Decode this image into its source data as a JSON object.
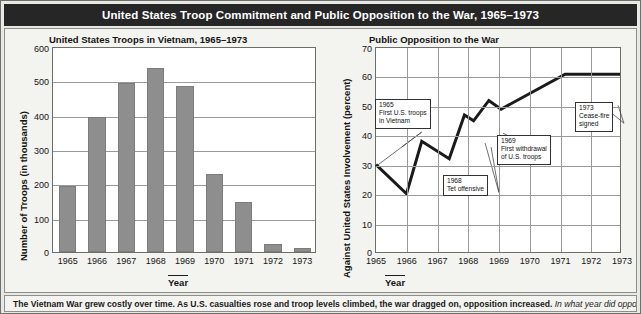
{
  "header": {
    "title": "United States Troop Commitment and Public Opposition to the War, 1965–1973"
  },
  "caption": {
    "lead": "The Vietnam War grew costly over time. As U.S. casualties rose and troop levels climbed, the war dragged on, opposition increased.",
    "question": "In what year did opposition"
  },
  "chart_data": [
    {
      "type": "bar",
      "title": "United States Troops in Vietnam, 1965–1973",
      "xlabel": "Year",
      "ylabel": "Number of Troops (in thousands)",
      "categories": [
        "1965",
        "1966",
        "1967",
        "1968",
        "1969",
        "1970",
        "1971",
        "1972",
        "1973"
      ],
      "values": [
        192,
        393,
        493,
        536,
        484,
        226,
        145,
        24,
        12
      ],
      "ylim": [
        0,
        600
      ],
      "yticks": [
        0,
        100,
        200,
        300,
        400,
        500,
        600
      ],
      "grid": true,
      "bar_color": "#8e8e8e"
    },
    {
      "type": "line",
      "title": "Public Opposition to the War",
      "xlabel": "Year",
      "ylabel": "Against United States Involvement (percent)",
      "ylim": [
        0,
        70
      ],
      "yticks": [
        0,
        10,
        20,
        30,
        40,
        50,
        60,
        70
      ],
      "xticks": [
        "1965",
        "1966",
        "1967",
        "1968",
        "1969",
        "1970",
        "1971",
        "1972",
        "1973"
      ],
      "grid": true,
      "line_color": "#1a1a1a",
      "points": [
        {
          "x": 1965.0,
          "y": 30
        },
        {
          "x": 1966.0,
          "y": 20
        },
        {
          "x": 1966.5,
          "y": 38
        },
        {
          "x": 1967.4,
          "y": 32
        },
        {
          "x": 1967.9,
          "y": 47
        },
        {
          "x": 1968.2,
          "y": 45
        },
        {
          "x": 1968.7,
          "y": 52
        },
        {
          "x": 1969.1,
          "y": 49
        },
        {
          "x": 1971.2,
          "y": 61
        },
        {
          "x": 1972.6,
          "y": 61
        },
        {
          "x": 1973.0,
          "y": 61
        }
      ],
      "annotations": [
        {
          "id": "ann-1965",
          "lines": [
            "1965",
            "First U.S. troops",
            "in Vietnam"
          ]
        },
        {
          "id": "ann-1968",
          "lines": [
            "1968",
            "Tet offensive"
          ]
        },
        {
          "id": "ann-1969",
          "lines": [
            "1969",
            "First withdrawal",
            "of U.S. troops"
          ]
        },
        {
          "id": "ann-1973",
          "lines": [
            "1973",
            "Cease-fire",
            "signed"
          ]
        }
      ]
    }
  ]
}
